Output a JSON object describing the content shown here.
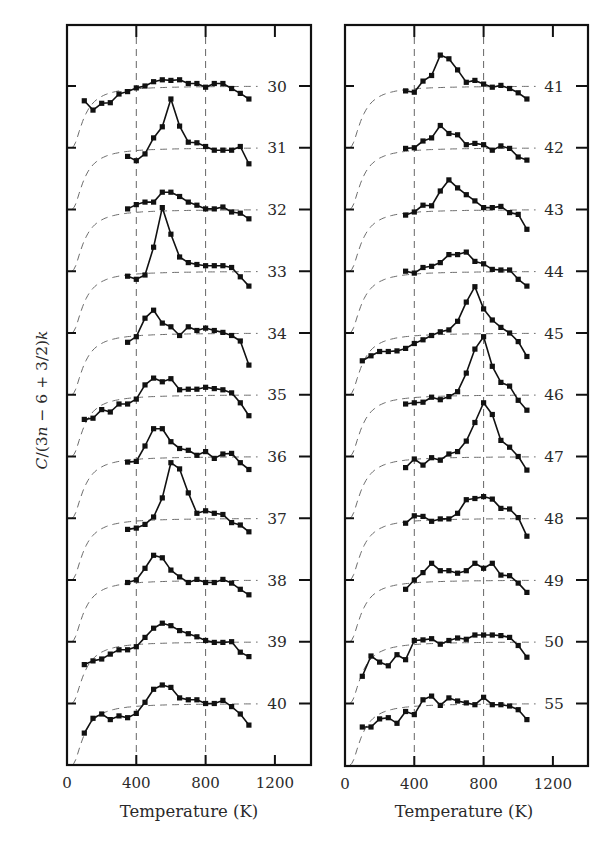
{
  "chart_data": {
    "type": "line",
    "title": "",
    "xlabel": "Temperature (K)",
    "ylabel": "C/(3n − 6 + 3/2)k",
    "ylabel_parts": [
      {
        "t": "C",
        "i": true
      },
      {
        "t": "/(3",
        "i": false
      },
      {
        "t": "n",
        "i": true
      },
      {
        "t": " − 6 + 3/2)",
        "i": false
      },
      {
        "t": "k",
        "i": true
      }
    ],
    "grid": "vertical dashed lines at 400 K and 800 K",
    "legend": "none; each curve labeled by cluster size n at right edge",
    "note": "Curves are vertically offset; each label marks the curve's baseline tick (value 1). Values below are offsets from baseline in units of tick spacing. Dashed curves show the harmonic (classical-limit) reference.",
    "xticks": [
      0,
      400,
      800,
      1200
    ],
    "xlim": [
      0,
      1410
    ],
    "x": [
      100,
      150,
      200,
      250,
      300,
      350,
      400,
      450,
      500,
      550,
      600,
      650,
      700,
      750,
      800,
      850,
      900,
      950,
      1000,
      1050
    ],
    "panels": [
      {
        "name": "left",
        "series": [
          {
            "name": "30",
            "x_start": 100,
            "values": [
              -0.24,
              -0.39,
              -0.28,
              -0.27,
              -0.13,
              -0.09,
              -0.03,
              0.0,
              0.07,
              0.1,
              0.09,
              0.1,
              0.04,
              0.04,
              -0.02,
              0.04,
              0.04,
              -0.04,
              -0.12,
              -0.21
            ]
          },
          {
            "name": "31",
            "x_start": 350,
            "values": [
              -0.14,
              -0.21,
              -0.1,
              0.16,
              0.34,
              0.79,
              0.35,
              0.09,
              0.08,
              0.02,
              -0.04,
              -0.04,
              -0.04,
              0.02,
              -0.26
            ]
          },
          {
            "name": "32",
            "x_start": 350,
            "values": [
              0.01,
              0.08,
              0.12,
              0.12,
              0.28,
              0.28,
              0.21,
              0.12,
              0.07,
              0.01,
              0.01,
              0.04,
              -0.04,
              -0.06,
              -0.15
            ]
          },
          {
            "name": "33",
            "x_start": 350,
            "values": [
              -0.08,
              -0.13,
              -0.06,
              0.39,
              1.03,
              0.6,
              0.23,
              0.14,
              0.11,
              0.09,
              0.09,
              0.09,
              0.06,
              -0.09,
              -0.24
            ]
          },
          {
            "name": "34",
            "x_start": 350,
            "values": [
              -0.15,
              -0.06,
              0.24,
              0.37,
              0.16,
              0.1,
              -0.04,
              0.1,
              0.04,
              0.08,
              0.04,
              0.01,
              -0.04,
              -0.13,
              -0.52
            ]
          },
          {
            "name": "35",
            "x_start": 100,
            "values": [
              -0.4,
              -0.38,
              -0.24,
              -0.28,
              -0.15,
              -0.15,
              -0.07,
              0.16,
              0.27,
              0.21,
              0.26,
              0.08,
              0.09,
              0.09,
              0.12,
              0.1,
              0.08,
              0.03,
              -0.13,
              -0.34
            ]
          },
          {
            "name": "36",
            "x_start": 350,
            "values": [
              -0.09,
              -0.08,
              0.17,
              0.45,
              0.45,
              0.24,
              0.13,
              0.1,
              0.02,
              0.08,
              -0.03,
              0.04,
              0.05,
              -0.1,
              -0.21
            ]
          },
          {
            "name": "37",
            "x_start": 350,
            "values": [
              -0.18,
              -0.16,
              -0.1,
              0.02,
              0.33,
              0.9,
              0.8,
              0.41,
              0.08,
              0.12,
              0.08,
              0.06,
              -0.07,
              -0.11,
              -0.22
            ]
          },
          {
            "name": "38",
            "x_start": 350,
            "values": [
              -0.04,
              0.0,
              0.19,
              0.4,
              0.36,
              0.16,
              0.05,
              -0.04,
              0.01,
              -0.04,
              -0.04,
              0.01,
              -0.05,
              -0.15,
              -0.24
            ]
          },
          {
            "name": "39",
            "x_start": 100,
            "values": [
              -0.37,
              -0.31,
              -0.28,
              -0.2,
              -0.13,
              -0.13,
              -0.08,
              0.07,
              0.22,
              0.3,
              0.26,
              0.18,
              0.13,
              0.08,
              0.02,
              -0.01,
              -0.01,
              0.0,
              -0.17,
              -0.24
            ]
          },
          {
            "name": "40",
            "x_start": 100,
            "values": [
              -0.48,
              -0.24,
              -0.17,
              -0.26,
              -0.2,
              -0.23,
              -0.16,
              0.02,
              0.23,
              0.3,
              0.26,
              0.09,
              0.06,
              0.06,
              0.0,
              0.0,
              0.05,
              -0.05,
              -0.17,
              -0.35
            ]
          }
        ]
      },
      {
        "name": "right",
        "series": [
          {
            "name": "41",
            "x_start": 350,
            "values": [
              -0.08,
              -0.1,
              0.08,
              0.17,
              0.5,
              0.44,
              0.26,
              0.06,
              0.09,
              0.03,
              -0.02,
              0.01,
              -0.04,
              -0.11,
              -0.21
            ]
          },
          {
            "name": "42",
            "x_start": 350,
            "values": [
              -0.01,
              0.0,
              0.11,
              0.16,
              0.36,
              0.23,
              0.21,
              0.05,
              0.07,
              0.05,
              -0.04,
              0.03,
              -0.01,
              -0.15,
              -0.2
            ]
          },
          {
            "name": "43",
            "x_start": 350,
            "values": [
              -0.09,
              -0.04,
              0.07,
              0.06,
              0.3,
              0.48,
              0.35,
              0.24,
              0.14,
              0.03,
              0.03,
              0.05,
              -0.05,
              -0.08,
              -0.32
            ]
          },
          {
            "name": "44",
            "x_start": 350,
            "values": [
              0.0,
              -0.03,
              0.06,
              0.08,
              0.14,
              0.27,
              0.27,
              0.31,
              0.16,
              0.12,
              0.03,
              0.02,
              0.02,
              -0.13,
              -0.24
            ]
          },
          {
            "name": "45",
            "x_start": 100,
            "values": [
              -0.45,
              -0.37,
              -0.3,
              -0.3,
              -0.29,
              -0.25,
              -0.17,
              -0.11,
              -0.04,
              0.02,
              0.05,
              0.19,
              0.5,
              0.75,
              0.39,
              0.21,
              0.09,
              0.0,
              -0.14,
              -0.38
            ]
          },
          {
            "name": "46",
            "x_start": 350,
            "values": [
              -0.15,
              -0.13,
              -0.12,
              -0.04,
              -0.08,
              -0.03,
              0.05,
              0.35,
              0.74,
              0.94,
              0.46,
              0.2,
              0.14,
              -0.09,
              -0.25
            ]
          },
          {
            "name": "47",
            "x_start": 350,
            "values": [
              -0.18,
              -0.04,
              -0.14,
              -0.02,
              -0.06,
              0.04,
              0.08,
              0.25,
              0.55,
              0.87,
              0.68,
              0.26,
              0.15,
              0.0,
              -0.22
            ]
          },
          {
            "name": "48",
            "x_start": 350,
            "values": [
              -0.08,
              0.04,
              0.03,
              -0.05,
              -0.01,
              -0.01,
              0.08,
              0.3,
              0.32,
              0.35,
              0.31,
              0.16,
              0.15,
              0.01,
              -0.29
            ]
          },
          {
            "name": "49",
            "x_start": 350,
            "values": [
              -0.15,
              0.0,
              0.12,
              0.27,
              0.15,
              0.15,
              0.11,
              0.15,
              0.27,
              0.19,
              0.27,
              0.08,
              0.07,
              -0.05,
              -0.2
            ]
          },
          {
            "name": "50",
            "x_start": 100,
            "values": [
              -0.56,
              -0.23,
              -0.33,
              -0.39,
              -0.21,
              -0.29,
              0.02,
              0.03,
              0.05,
              -0.04,
              0.02,
              0.06,
              0.04,
              0.11,
              0.11,
              0.11,
              0.1,
              0.07,
              -0.06,
              -0.25
            ]
          },
          {
            "name": "55",
            "x_start": 100,
            "values": [
              -0.38,
              -0.38,
              -0.25,
              -0.23,
              -0.32,
              -0.13,
              -0.18,
              0.06,
              0.12,
              -0.03,
              0.09,
              0.04,
              0.01,
              -0.02,
              0.1,
              -0.02,
              -0.02,
              -0.04,
              -0.1,
              -0.26
            ]
          }
        ]
      }
    ],
    "harmonic_reference": {
      "style": "dashed gray",
      "theta_K": 300,
      "description": "rises from baseline−1 at 0 K to baseline by ~400 K, then flat"
    }
  },
  "axes": {
    "x_tick_labels": [
      "0",
      "400",
      "800",
      "1200"
    ],
    "xlabel": "Temperature (K)",
    "ylabel": "C/(3n − 6 + 3/2)k"
  },
  "colors": {
    "ink": "#111111",
    "dash": "#6d6d6d",
    "text": "#2a2a2a"
  }
}
